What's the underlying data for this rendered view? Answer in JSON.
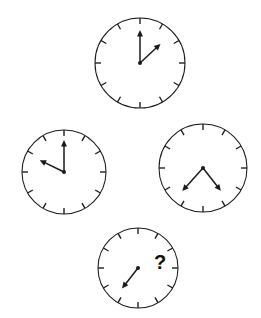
{
  "puzzle": {
    "title": "Clock sequence reasoning puzzle",
    "background_color": "#ffffff",
    "ink_color": "#1a1a1a",
    "unknown_marker": "?",
    "tick_count": 12,
    "clocks": [
      {
        "name": "clock-top",
        "position_label": "top",
        "cx": 140,
        "cy": 63,
        "r": 45,
        "tick_inner": 39,
        "tick_outer": 45,
        "hands": [
          {
            "name": "minute-hand",
            "angle_deg": 0,
            "length": 33,
            "clock_position": "12:00",
            "arrow": true
          },
          {
            "name": "hour-hand",
            "angle_deg": 47,
            "length": 28,
            "clock_position": "1:35",
            "arrow": true
          }
        ],
        "has_question_mark": false
      },
      {
        "name": "clock-left",
        "position_label": "left",
        "cx": 64,
        "cy": 172,
        "r": 42,
        "tick_inner": 36,
        "tick_outer": 42,
        "hands": [
          {
            "name": "minute-hand",
            "angle_deg": 0,
            "length": 32,
            "clock_position": "12:00",
            "arrow": true
          },
          {
            "name": "hour-hand",
            "angle_deg": 296,
            "length": 27,
            "clock_position": "9:50",
            "arrow": true
          }
        ],
        "has_question_mark": false
      },
      {
        "name": "clock-right",
        "position_label": "right",
        "cx": 203,
        "cy": 168,
        "r": 44,
        "tick_inner": 38,
        "tick_outer": 44,
        "hands": [
          {
            "name": "minute-hand",
            "angle_deg": 222,
            "length": 31,
            "clock_position": "7:24",
            "arrow": true
          },
          {
            "name": "hour-hand",
            "angle_deg": 142,
            "length": 29,
            "clock_position": "4:44",
            "arrow": true
          }
        ],
        "has_question_mark": false
      },
      {
        "name": "clock-bottom",
        "position_label": "bottom",
        "cx": 138,
        "cy": 268,
        "r": 40,
        "tick_inner": 34,
        "tick_outer": 40,
        "hands": [
          {
            "name": "hour-hand",
            "angle_deg": 218,
            "length": 26,
            "clock_position": "7:16",
            "arrow": true
          }
        ],
        "has_question_mark": true,
        "question_mark_x": 160,
        "question_mark_y": 264
      }
    ]
  }
}
